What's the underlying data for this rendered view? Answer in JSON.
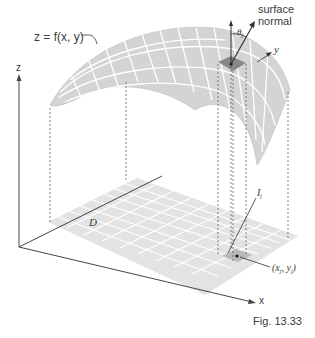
{
  "figure": {
    "caption": "Fig. 13.33",
    "surface_label": "z = f(x, y)",
    "normal_label_line1": "surface",
    "normal_label_line2": "normal",
    "angle_label": "θ",
    "angle_subscript": "j",
    "region_label": "D",
    "patch_label": "I",
    "patch_subscript": "j",
    "point_label": "(x",
    "point_sub1": "j",
    "point_mid": ", y",
    "point_sub2": "j",
    "point_close": ")",
    "axes": {
      "x": "x",
      "y": "y",
      "z": "z"
    },
    "colors": {
      "surface": "#d6d6d6",
      "region": "#e2e2e2",
      "patch_dark": "#8a8a8a",
      "patch_light": "#bdbdbd",
      "line": "#444444",
      "grid": "#ffffff"
    }
  }
}
